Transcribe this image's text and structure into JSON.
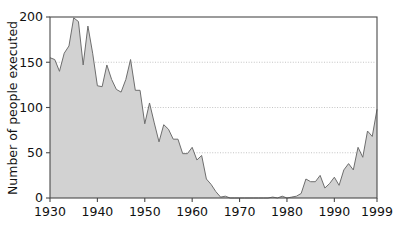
{
  "chart_data": {
    "type": "area",
    "title": "",
    "subtitle": "",
    "xlabel": "",
    "ylabel": "Number of people executed",
    "xlim": [
      1930,
      1999
    ],
    "ylim": [
      0,
      200
    ],
    "grid": true,
    "grid_axis": "y",
    "legend": null,
    "series_name": "People executed",
    "fill_color": "#d2d2d2",
    "line_color": "#6e6e6e",
    "axis_color": "#4a4a4a",
    "grid_color": "#bdbdbd",
    "background_color": "#ffffff",
    "xticks": [
      1930,
      1940,
      1950,
      1960,
      1970,
      1980,
      1990,
      1999
    ],
    "xtick_labels": [
      "1930",
      "1940",
      "1950",
      "1960",
      "1970",
      "1980",
      "1990",
      "1999"
    ],
    "yticks": [
      0,
      50,
      100,
      150,
      200
    ],
    "ytick_labels": [
      "0",
      "50",
      "100",
      "150",
      "200"
    ],
    "x": [
      1930,
      1931,
      1932,
      1933,
      1934,
      1935,
      1936,
      1937,
      1938,
      1939,
      1940,
      1941,
      1942,
      1943,
      1944,
      1945,
      1946,
      1947,
      1948,
      1949,
      1950,
      1951,
      1952,
      1953,
      1954,
      1955,
      1956,
      1957,
      1958,
      1959,
      1960,
      1961,
      1962,
      1963,
      1964,
      1965,
      1966,
      1967,
      1968,
      1969,
      1970,
      1971,
      1972,
      1973,
      1974,
      1975,
      1976,
      1977,
      1978,
      1979,
      1980,
      1981,
      1982,
      1983,
      1984,
      1985,
      1986,
      1987,
      1988,
      1989,
      1990,
      1991,
      1992,
      1993,
      1994,
      1995,
      1996,
      1997,
      1998,
      1999
    ],
    "values": [
      155,
      153,
      140,
      160,
      168,
      199,
      195,
      147,
      190,
      160,
      124,
      123,
      147,
      131,
      120,
      117,
      131,
      153,
      119,
      119,
      82,
      105,
      83,
      62,
      81,
      76,
      65,
      65,
      49,
      49,
      56,
      42,
      47,
      21,
      15,
      7,
      1,
      2,
      0,
      0,
      0,
      0,
      0,
      0,
      0,
      0,
      0,
      1,
      0,
      2,
      0,
      1,
      2,
      5,
      21,
      18,
      18,
      25,
      11,
      16,
      23,
      14,
      31,
      38,
      31,
      56,
      45,
      74,
      68,
      98
    ],
    "annotations": []
  }
}
